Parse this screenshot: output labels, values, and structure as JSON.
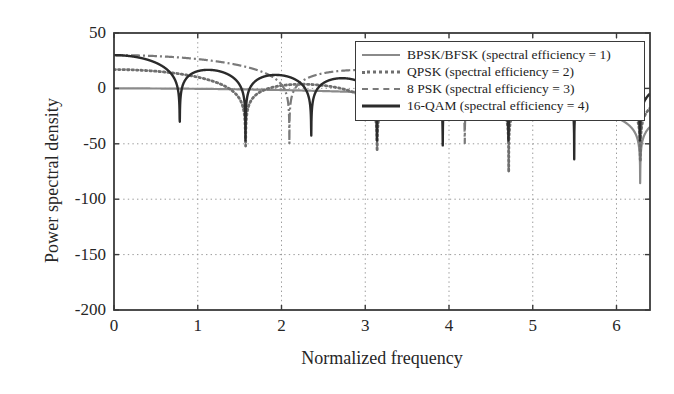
{
  "chart_data": {
    "type": "line",
    "title": "",
    "xlabel": "Normalized frequency",
    "ylabel": "Power spectral density",
    "xlim": [
      0,
      6.4
    ],
    "ylim": [
      -200,
      50
    ],
    "xticks": [
      "0",
      "1",
      "2",
      "3",
      "4",
      "5",
      "6"
    ],
    "xtick_values": [
      0,
      1,
      2,
      3,
      4,
      5,
      6
    ],
    "yticks": [
      "50",
      "0",
      "-50",
      "-100",
      "-150",
      "-200"
    ],
    "ytick_values": [
      50,
      0,
      -50,
      -100,
      -150,
      -200
    ],
    "grid": true,
    "grid_style": "dotted",
    "legend_position": "upper right",
    "series": [
      {
        "name": "BPSK/BFSK (spectral efficiency = 1)",
        "efficiency": 1,
        "style": "solid",
        "color": "#8a8a8a",
        "null_spacing": 6.283,
        "peak_db": 0,
        "x": [
          0,
          0.2,
          0.4,
          0.6,
          0.8,
          1.0,
          1.2,
          1.4,
          1.6,
          1.8,
          2.0,
          2.2,
          2.4,
          2.6,
          2.8,
          3.0,
          3.2,
          3.4,
          3.6,
          3.8,
          4.0,
          4.2,
          4.4,
          4.6,
          4.8,
          5.0,
          5.2,
          5.4,
          5.6,
          5.8,
          6.0,
          6.2,
          6.28
        ],
        "y": [
          0,
          -0.3,
          -1.2,
          -2.7,
          -4.9,
          -7.7,
          -11.2,
          -15.5,
          -20.6,
          -26.9,
          -34.6,
          -44.5,
          -57.9,
          -78.8,
          -97.0,
          -82.2,
          -73.5,
          -69.0,
          -66.0,
          -64.0,
          -62.6,
          -61.8,
          -61.5,
          -61.8,
          -62.6,
          -64.0,
          -66.0,
          -69.0,
          -73.5,
          -82.2,
          -97.0,
          -140.0,
          -200.0
        ]
      },
      {
        "name": "QPSK (spectral efficiency = 2)",
        "efficiency": 2,
        "style": "dotted",
        "color": "#6f6f6f",
        "null_spacing": 1.571,
        "peak_db": 17,
        "x": [
          0,
          0.2,
          0.4,
          0.6,
          0.8,
          1.0,
          1.2,
          1.4,
          1.571,
          1.8,
          2.0,
          2.2,
          2.36,
          2.6,
          2.8,
          3.0,
          3.142,
          3.4,
          3.6,
          3.8,
          4.0,
          4.2,
          4.4,
          4.712,
          5.0,
          5.2,
          5.5,
          5.8,
          6.0,
          6.283
        ],
        "y": [
          17,
          16.4,
          13.8,
          8.4,
          -0.6,
          -14.5,
          -36.0,
          -78.0,
          -200,
          -74.0,
          -56.0,
          -48.0,
          -46.5,
          -50.0,
          -60.0,
          -84.0,
          -200,
          -86.0,
          -73.0,
          -69.0,
          -70.0,
          -78.0,
          -96.0,
          -200,
          -95.0,
          -86.0,
          -88.0,
          -105.0,
          -128.0,
          -200
        ]
      },
      {
        "name": "8 PSK (spectral efficiency = 3)",
        "efficiency": 3,
        "style": "dashdot",
        "color": "#7a7a7a",
        "null_spacing": 2.094,
        "peak_db": 30,
        "x": [
          0,
          0.2,
          0.4,
          0.6,
          0.8,
          1.0,
          1.047,
          1.2,
          1.4,
          1.6,
          1.8,
          2.0,
          2.094,
          2.3,
          2.5,
          2.8,
          3.0,
          3.142,
          3.4,
          3.7,
          4.0,
          4.189,
          4.5,
          4.7,
          5.0,
          5.236,
          5.5,
          5.8,
          6.0,
          6.283
        ],
        "y": [
          30,
          28.6,
          23.4,
          13.6,
          -2.5,
          -34.0,
          -200,
          -52.0,
          -39.0,
          -35.5,
          -38.0,
          -52.0,
          -200,
          -62.0,
          -88.0,
          -120.0,
          -150.0,
          -200,
          -105.0,
          -86.0,
          -82.0,
          -200,
          -84.0,
          -82.0,
          -96.0,
          -200,
          -104.0,
          -94.0,
          -92.0,
          -97.0
        ]
      },
      {
        "name": "16-QAM (spectral efficiency = 4)",
        "efficiency": 4,
        "style": "solid",
        "color": "#2b2b2b",
        "null_spacing": 0.785,
        "peak_db": 30,
        "x": [
          0,
          0.2,
          0.4,
          0.6,
          0.785,
          1.0,
          1.1,
          1.3,
          1.571,
          1.8,
          1.95,
          2.1,
          2.356,
          2.6,
          2.75,
          2.9,
          3.142,
          3.35,
          3.55,
          3.75,
          3.927,
          4.1,
          4.3,
          4.5,
          4.712,
          4.9,
          5.1,
          5.3,
          5.498,
          5.65,
          5.85,
          6.05,
          6.283
        ],
        "y": [
          30,
          26.0,
          13.0,
          -14.0,
          -200,
          -42.0,
          -30.5,
          -36.0,
          -200,
          -58.0,
          -51.5,
          -58.0,
          -200,
          -70.0,
          -63.0,
          -70.0,
          -200,
          -80.0,
          -74.0,
          -80.0,
          -200,
          -88.0,
          -82.0,
          -88.0,
          -200,
          -95.0,
          -90.0,
          -95.0,
          -200,
          -100.0,
          -95.0,
          -102.0,
          -200
        ]
      }
    ]
  },
  "axes": {
    "y_axis_label": "Power spectral density",
    "x_axis_label": "Normalized frequency"
  }
}
